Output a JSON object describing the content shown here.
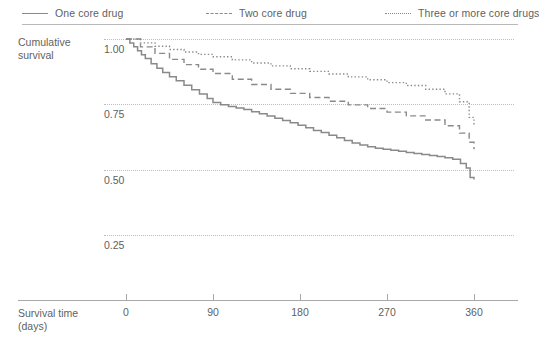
{
  "legend": {
    "items": [
      {
        "label": "One core drug",
        "style": "solid",
        "swatch_icon": "solid-line-icon"
      },
      {
        "label": "Two core drug",
        "style": "dashed",
        "swatch_icon": "dashed-line-icon"
      },
      {
        "label": "Three or more core drugs",
        "style": "dotted",
        "swatch_icon": "dotted-line-icon"
      }
    ]
  },
  "axes": {
    "ylabel_line1": "Cumulative",
    "ylabel_line2": "survival",
    "xlabel_line1": "Survival time",
    "xlabel_line2": "(days)",
    "yticks": [
      "1.00",
      "0.75",
      "0.50",
      "0.25"
    ],
    "xticks": [
      "0",
      "90",
      "180",
      "270",
      "360"
    ]
  },
  "chart_data": {
    "type": "line",
    "title": "",
    "subtitle": "",
    "xlabel": "Survival time (days)",
    "ylabel": "Cumulative survival",
    "xlim": [
      0,
      360
    ],
    "ylim": [
      0.15,
      1.04
    ],
    "xticks": [
      0,
      90,
      180,
      270,
      360
    ],
    "yticks": [
      0.25,
      0.5,
      0.75,
      1.0
    ],
    "grid": "horizontal-dotted",
    "legend_position": "top",
    "line_color": "#8a8a8a",
    "background": "#ffffff",
    "step_function": true,
    "series": [
      {
        "name": "One core drug",
        "style": "solid",
        "x": [
          0,
          4,
          8,
          12,
          16,
          20,
          26,
          32,
          38,
          45,
          52,
          60,
          68,
          76,
          84,
          90,
          98,
          106,
          114,
          122,
          130,
          138,
          146,
          154,
          162,
          170,
          178,
          186,
          194,
          202,
          210,
          218,
          226,
          234,
          242,
          250,
          258,
          266,
          274,
          282,
          290,
          298,
          306,
          314,
          322,
          330,
          338,
          346,
          352,
          356,
          360
        ],
        "y": [
          1.0,
          0.985,
          0.97,
          0.955,
          0.94,
          0.925,
          0.905,
          0.888,
          0.872,
          0.856,
          0.84,
          0.823,
          0.806,
          0.79,
          0.772,
          0.757,
          0.748,
          0.742,
          0.736,
          0.73,
          0.722,
          0.714,
          0.705,
          0.697,
          0.688,
          0.68,
          0.67,
          0.66,
          0.65,
          0.642,
          0.632,
          0.622,
          0.612,
          0.602,
          0.594,
          0.588,
          0.582,
          0.578,
          0.574,
          0.57,
          0.566,
          0.562,
          0.558,
          0.554,
          0.55,
          0.546,
          0.54,
          0.524,
          0.506,
          0.47,
          0.462
        ]
      },
      {
        "name": "Two core drug",
        "style": "dashed",
        "x": [
          0,
          15,
          30,
          45,
          60,
          75,
          90,
          110,
          130,
          150,
          170,
          190,
          210,
          230,
          250,
          270,
          290,
          310,
          330,
          345,
          355,
          360
        ],
        "y": [
          1.0,
          0.97,
          0.945,
          0.922,
          0.902,
          0.884,
          0.868,
          0.846,
          0.826,
          0.808,
          0.792,
          0.776,
          0.762,
          0.748,
          0.734,
          0.72,
          0.706,
          0.69,
          0.668,
          0.64,
          0.605,
          0.578
        ]
      },
      {
        "name": "Three or more core drugs",
        "style": "dotted",
        "x": [
          0,
          15,
          30,
          45,
          60,
          75,
          90,
          110,
          130,
          150,
          170,
          190,
          210,
          230,
          250,
          270,
          290,
          310,
          330,
          345,
          355,
          360
        ],
        "y": [
          1.0,
          0.985,
          0.972,
          0.96,
          0.95,
          0.941,
          0.932,
          0.92,
          0.908,
          0.897,
          0.886,
          0.876,
          0.866,
          0.855,
          0.844,
          0.833,
          0.822,
          0.808,
          0.79,
          0.76,
          0.7,
          0.668
        ]
      }
    ]
  }
}
